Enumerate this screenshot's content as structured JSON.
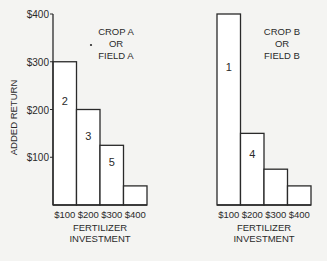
{
  "chart_data": [
    {
      "type": "bar",
      "title": "CROP A OR FIELD A",
      "title_lines": [
        "CROP A",
        "OR",
        "FIELD A"
      ],
      "xlabel": "FERTILIZER INVESTMENT",
      "xlabel_lines": [
        "FERTILIZER",
        "INVESTMENT"
      ],
      "ylabel": "ADDED RETURN",
      "categories": [
        "$100",
        "$200",
        "$300",
        "$400"
      ],
      "values": [
        300,
        200,
        125,
        40
      ],
      "bar_labels": [
        "2",
        "3",
        "5",
        ""
      ],
      "yticks": [
        "$100",
        "$200",
        "$300",
        "$400"
      ],
      "ytick_values": [
        100,
        200,
        300,
        400
      ],
      "ylim": [
        0,
        400
      ],
      "grid": false
    },
    {
      "type": "bar",
      "title": "CROP B OR FIELD B",
      "title_lines": [
        "CROP B",
        "OR",
        "FIELD B"
      ],
      "xlabel": "FERTILIZER INVESTMENT",
      "xlabel_lines": [
        "FERTILIZER",
        "INVESTMENT"
      ],
      "ylabel": "",
      "categories": [
        "$100",
        "$200",
        "$300",
        "$400"
      ],
      "values": [
        400,
        150,
        75,
        40
      ],
      "bar_labels": [
        "1",
        "4",
        "",
        ""
      ],
      "ylim": [
        0,
        400
      ],
      "grid": false
    }
  ],
  "colors": {
    "ink": "#2a2a2a",
    "paper": "#f4f4f2",
    "bar_fill": "#ffffff"
  }
}
